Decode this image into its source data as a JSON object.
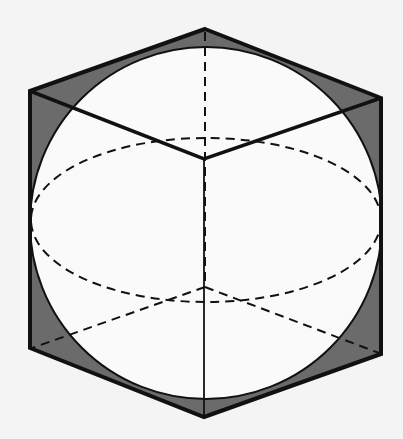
{
  "diagram": {
    "colors": {
      "background": "#f4f4f4",
      "sphere_fill": "#fafafa",
      "shaded_region": "#6b6b6b",
      "stroke": "#111111"
    },
    "cube_vertices": {
      "top": [
        205,
        29
      ],
      "upper_left": [
        30,
        91
      ],
      "upper_right": [
        381,
        98
      ],
      "front_top": [
        204,
        159
      ],
      "lower_left": [
        30,
        348
      ],
      "lower_right": [
        381,
        354
      ],
      "bottom": [
        204,
        417
      ],
      "back_bottom_hidden": [
        205,
        287
      ]
    },
    "sphere": {
      "cx": 206,
      "cy": 223,
      "r": 176
    },
    "equator_ellipse": {
      "cx": 206,
      "cy": 220,
      "rx": 176,
      "ry": 82
    },
    "visible_edges": [
      "top-upper_left",
      "top-upper_right",
      "upper_left-front_top",
      "upper_right-front_top",
      "front_top-bottom",
      "upper_left-lower_left",
      "upper_right-lower_right",
      "lower_left-bottom",
      "lower_right-bottom"
    ],
    "hidden_edges": [
      "top-back_bottom_hidden",
      "back_bottom_hidden-lower_left",
      "back_bottom_hidden-lower_right"
    ]
  }
}
